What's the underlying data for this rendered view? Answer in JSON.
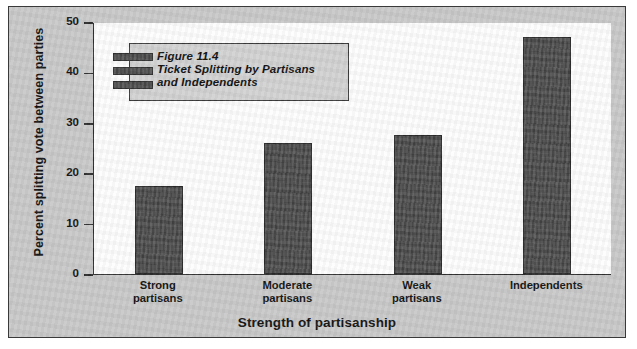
{
  "figure": {
    "caption_lines": [
      "Figure 11.4",
      "Ticket Splitting by Partisans",
      "and Independents"
    ]
  },
  "chart_data": {
    "type": "bar",
    "title": "Figure 11.4 Ticket Splitting by Partisans and Independents",
    "categories": [
      "Strong\npartisans",
      "Moderate\npartisans",
      "Weak\npartisans",
      "Independents"
    ],
    "values": [
      17.5,
      26,
      27.5,
      47
    ],
    "xlabel": "Strength of partisanship",
    "ylabel": "Percent splitting vote between parties",
    "ylim": [
      0,
      50
    ],
    "yticks": [
      "0",
      "10",
      "20",
      "30",
      "40",
      "50"
    ],
    "grid": false,
    "legend": "none",
    "bar_color": "#4b4b4b",
    "plot_background": "#fdfdfd",
    "panel_background": "#c9c9c9"
  }
}
